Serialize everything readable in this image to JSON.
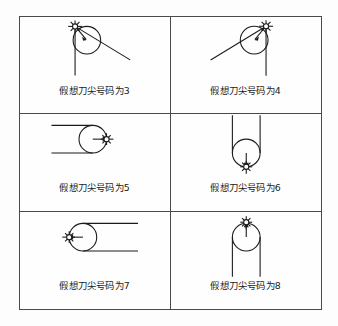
{
  "figure": {
    "title_text": "",
    "background_color": "#fdfdfd",
    "line_color": "#1b1b1b",
    "border_color": "#4a4a4a",
    "columns": 2,
    "rows": 3
  },
  "cells": [
    {
      "id": "cell-3",
      "label": "假想刀尖号码为3",
      "nose_number": "3",
      "marker_position": "top-left",
      "marker_name": "tool-nose-marker",
      "edges": "vertical-down-and-diagonal-down-right",
      "radius_arrow": "from-nose-to-center-down-right"
    },
    {
      "id": "cell-4",
      "label": "假想刀尖号码为4",
      "nose_number": "4",
      "marker_position": "top-right",
      "marker_name": "tool-nose-marker",
      "edges": "vertical-down-and-diagonal-up-left",
      "radius_arrow": "from-nose-to-center-down-left"
    },
    {
      "id": "cell-5",
      "label": "假想刀尖号码为5",
      "nose_number": "5",
      "marker_position": "right",
      "marker_name": "tool-nose-marker",
      "edges": "two-horizontal-lines-to-left",
      "radius_arrow": "pointing-right"
    },
    {
      "id": "cell-6",
      "label": "假想刀尖号码为6",
      "nose_number": "6",
      "marker_position": "bottom",
      "marker_name": "tool-nose-marker",
      "edges": "two-vertical-lines-upward",
      "radius_arrow": "pointing-down"
    },
    {
      "id": "cell-7",
      "label": "假想刀尖号码为7",
      "nose_number": "7",
      "marker_position": "left",
      "marker_name": "tool-nose-marker",
      "edges": "two-horizontal-lines-to-right",
      "radius_arrow": "pointing-left"
    },
    {
      "id": "cell-8",
      "label": "假想刀尖号码为8",
      "nose_number": "8",
      "marker_position": "top",
      "marker_name": "tool-nose-marker",
      "edges": "two-vertical-lines-downward",
      "radius_arrow": "pointing-up"
    }
  ]
}
